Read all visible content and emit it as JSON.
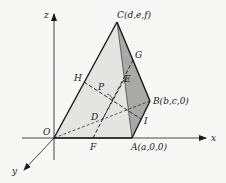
{
  "diagram": {
    "type": "3d-tetrahedron-coordinate-figure",
    "axes": {
      "x": "x",
      "y": "y",
      "z": "z"
    },
    "vertices": {
      "O": "O",
      "A": "A(a,0,0)",
      "B": "B(b,c,0)",
      "C": "C(d,e,f)"
    },
    "points": {
      "D": "D",
      "E": "E",
      "F": "F",
      "G": "G",
      "H": "H",
      "I": "I",
      "P": "P"
    },
    "colors": {
      "background": "#f7f7f5",
      "line": "#1a1a1a",
      "face_light": "#e4e4e2",
      "face_dark": "#a9a9a7"
    }
  }
}
